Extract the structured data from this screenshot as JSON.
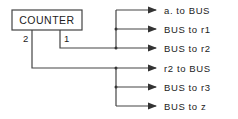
{
  "diagram": {
    "counter": {
      "label": "COUNTER"
    },
    "ports": [
      {
        "id": "2",
        "label": "2"
      },
      {
        "id": "1",
        "label": "1"
      }
    ],
    "outputs_port1": [
      {
        "label": "a. to BUS"
      },
      {
        "label": "BUS to r1"
      },
      {
        "label": "BUS to r2"
      }
    ],
    "outputs_port2": [
      {
        "label": "r2 to BUS"
      },
      {
        "label": "BUS to r3"
      },
      {
        "label": "BUS to z"
      }
    ],
    "colors": {
      "line": "#444444",
      "text": "#222222",
      "background": "#ffffff"
    }
  }
}
